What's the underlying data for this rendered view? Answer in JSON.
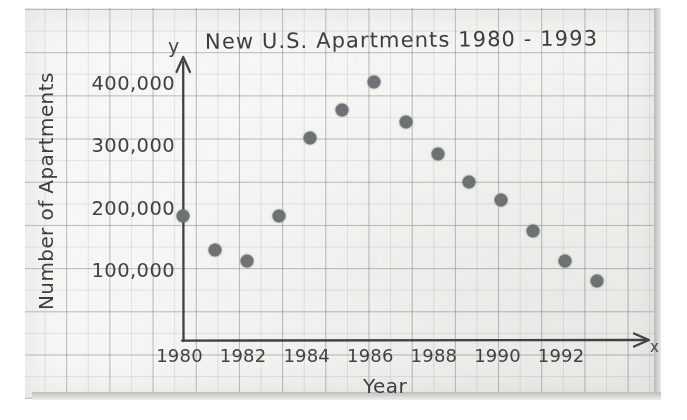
{
  "chart_data": {
    "type": "scatter",
    "title": "New U.S. Apartments 1980 - 1993",
    "xlabel": "Year",
    "ylabel": "Number of Apartments",
    "x_axis_letter": "y",
    "y_axis_letter": "x",
    "grid": true,
    "legend": "none",
    "xlim": [
      1979.4,
      1993.8
    ],
    "ylim": [
      0,
      440000
    ],
    "x_ticks": [
      "1980",
      "1982",
      "1984",
      "1986",
      "1988",
      "1990",
      "1992"
    ],
    "x_tick_values": [
      1980,
      1982,
      1984,
      1986,
      1988,
      1990,
      1992
    ],
    "y_ticks": [
      "100,000",
      "200,000",
      "300,000",
      "400,000"
    ],
    "y_tick_values": [
      100000,
      200000,
      300000,
      400000
    ],
    "x": [
      1980,
      1981,
      1982,
      1983,
      1984,
      1985,
      1986,
      1987,
      1988,
      1989,
      1990,
      1991,
      1992,
      1993
    ],
    "values": [
      190000,
      135000,
      118000,
      190000,
      315000,
      360000,
      405000,
      340000,
      290000,
      245000,
      215000,
      165000,
      118000,
      85000
    ],
    "marker_color": "#6f7275",
    "axis_color": "#3f4245",
    "paper_color": "#f7f7f5",
    "grid_color": "#82878c"
  },
  "figure": {
    "media": "hand-drawn graph on grid paper"
  }
}
